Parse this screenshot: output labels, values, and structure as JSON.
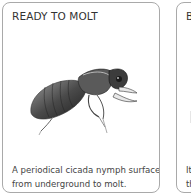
{
  "cards": [
    {
      "title": "READY TO MOLT",
      "image": "cicada-nymph-illustration",
      "caption_line1": "A periodical cicada nymph surfaces",
      "caption_line2": "from underground to molt."
    },
    {
      "title": "B",
      "caption_line1": "It",
      "caption_line2": "th"
    }
  ],
  "colors": {
    "border": "#a9a9a9",
    "title_text": "#333333",
    "caption_text": "#444444",
    "background": "#ffffff"
  }
}
